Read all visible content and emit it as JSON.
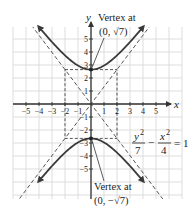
{
  "diagram": {
    "type": "hyperbola-graph",
    "equation": {
      "numerator_left": "y",
      "exp_left": "2",
      "denominator_left": "7",
      "minus": "−",
      "numerator_right": "x",
      "exp_right": "2",
      "denominator_right": "4",
      "equals": "= 1"
    },
    "axes": {
      "x_label": "x",
      "y_label": "y",
      "x_ticks": [
        "−5",
        "−4",
        "−3",
        "−2",
        "−1",
        "1",
        "2",
        "3",
        "4",
        "5"
      ],
      "y_ticks": [
        "5",
        "4",
        "3",
        "2",
        "1",
        "−1",
        "−2",
        "−3",
        "−4",
        "−5"
      ]
    },
    "annotations": {
      "top_vertex_line1": "Vertex at",
      "top_vertex_line2": "(0, √7)",
      "bottom_vertex_line1": "Vertex at",
      "bottom_vertex_line2": "(0, −√7)"
    },
    "colors": {
      "curve": "#3a3a3a",
      "grid": "#d4d4d4",
      "axis": "#333333",
      "dashed": "#444444"
    },
    "asymptotes": [
      "y = (√7/2)x",
      "y = −(√7/2)x"
    ],
    "fundamental_rectangle": {
      "x": [
        -2,
        2
      ],
      "y": [
        -2.6458,
        2.6458
      ]
    }
  }
}
